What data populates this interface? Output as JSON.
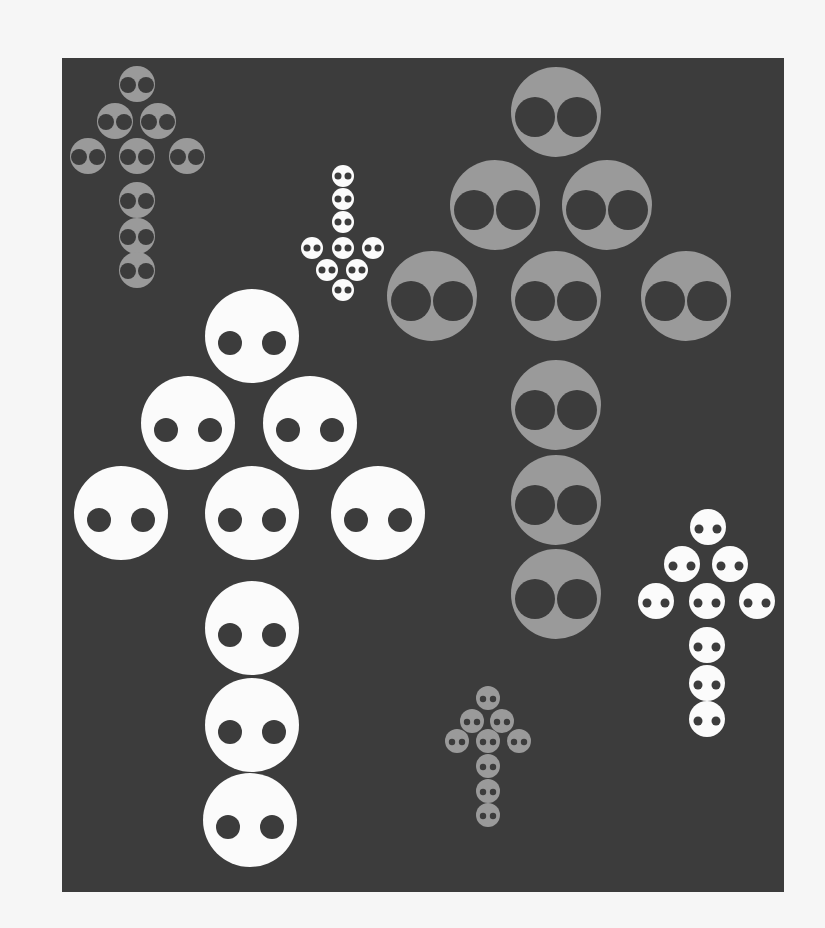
{
  "scene": {
    "description": "Dark gray panel with six arrows composed of circles, each circle containing two dark dots",
    "background_color": "#f6f6f6",
    "panel_color": "#3c3c3c",
    "panel": {
      "x": 62,
      "y": 58,
      "width": 722,
      "height": 834
    }
  },
  "colors": {
    "white": "#fbfbfb",
    "gray": "#9a9a9a",
    "dot": "#3c3c3c"
  },
  "arrows": [
    {
      "name": "small-gray-up-arrow-top-left",
      "direction": "up",
      "fill": "gray",
      "radius": 18,
      "eye_radius": 8,
      "eye_dx": 9,
      "eye_dy": 1,
      "circles": [
        [
          137,
          84
        ],
        [
          115,
          121
        ],
        [
          158,
          121
        ],
        [
          88,
          156
        ],
        [
          137,
          156
        ],
        [
          187,
          156
        ],
        [
          137,
          200
        ],
        [
          137,
          236
        ],
        [
          137,
          270
        ]
      ]
    },
    {
      "name": "small-white-down-arrow",
      "direction": "down",
      "fill": "white",
      "radius": 11,
      "eye_radius": 3.5,
      "eye_dx": 5,
      "eye_dy": 0,
      "circles": [
        [
          343,
          176
        ],
        [
          343,
          199
        ],
        [
          343,
          222
        ],
        [
          312,
          248
        ],
        [
          343,
          248
        ],
        [
          373,
          248
        ],
        [
          327,
          270
        ],
        [
          357,
          270
        ],
        [
          343,
          290
        ]
      ]
    },
    {
      "name": "large-gray-up-arrow",
      "direction": "up",
      "fill": "gray",
      "radius": 45,
      "eye_radius": 20,
      "eye_dx": 21,
      "eye_dy": 5,
      "circles": [
        [
          556,
          112
        ],
        [
          495,
          205
        ],
        [
          607,
          205
        ],
        [
          432,
          296
        ],
        [
          556,
          296
        ],
        [
          686,
          296
        ],
        [
          556,
          405
        ],
        [
          556,
          500
        ],
        [
          556,
          594
        ]
      ]
    },
    {
      "name": "large-white-up-arrow",
      "direction": "up",
      "fill": "white",
      "radius": 47,
      "eye_radius": 12,
      "eye_dx": 22,
      "eye_dy": 7,
      "circles": [
        [
          252,
          336
        ],
        [
          188,
          423
        ],
        [
          310,
          423
        ],
        [
          121,
          513
        ],
        [
          252,
          513
        ],
        [
          378,
          513
        ],
        [
          252,
          628
        ],
        [
          252,
          725
        ],
        [
          250,
          820
        ]
      ]
    },
    {
      "name": "medium-white-up-arrow-right",
      "direction": "up",
      "fill": "white",
      "radius": 18,
      "eye_radius": 4.5,
      "eye_dx": 9,
      "eye_dy": 2,
      "circles": [
        [
          708,
          527
        ],
        [
          682,
          564
        ],
        [
          730,
          564
        ],
        [
          656,
          601
        ],
        [
          707,
          601
        ],
        [
          757,
          601
        ],
        [
          707,
          645
        ],
        [
          707,
          683
        ],
        [
          707,
          719
        ]
      ]
    },
    {
      "name": "small-gray-up-arrow-bottom",
      "direction": "up",
      "fill": "gray",
      "radius": 12,
      "eye_radius": 3.2,
      "eye_dx": 5,
      "eye_dy": 1,
      "circles": [
        [
          488,
          698
        ],
        [
          472,
          721
        ],
        [
          502,
          721
        ],
        [
          457,
          741
        ],
        [
          488,
          741
        ],
        [
          519,
          741
        ],
        [
          488,
          766
        ],
        [
          488,
          791
        ],
        [
          488,
          815
        ]
      ]
    }
  ]
}
